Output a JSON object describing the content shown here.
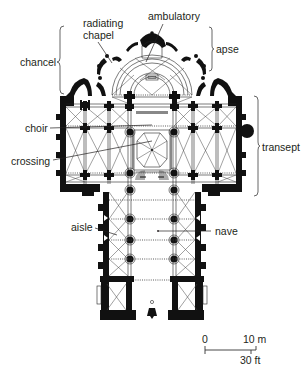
{
  "diagram": {
    "type": "architectural floor plan",
    "labels": {
      "ambulatory": "ambulatory",
      "radiating_chapel_line1": "radiating",
      "radiating_chapel_line2": "chapel",
      "chancel": "chancel",
      "apse": "apse",
      "choir": "choir",
      "crossing": "crossing",
      "transept": "transept",
      "aisle": "aisle",
      "nave": "nave"
    },
    "scale_bar": {
      "zero": "0",
      "metric": "10 m",
      "imperial": "30 ft"
    },
    "colors": {
      "walls": "#111111",
      "lines": "#231f20",
      "background": "#ffffff",
      "brace": "#555555"
    }
  }
}
